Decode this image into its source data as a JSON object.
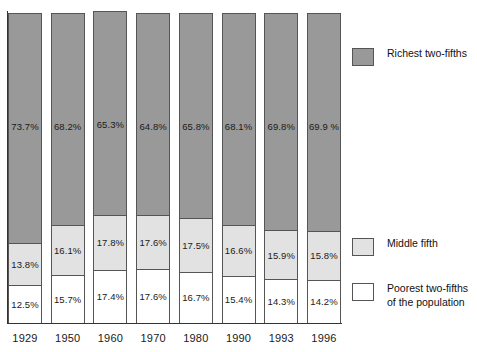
{
  "chart_data": {
    "type": "bar",
    "subtype": "stacked-bar-100-percent",
    "title": "",
    "subtitle": "",
    "xlabel": "",
    "ylabel": "",
    "ylim": [
      0,
      100
    ],
    "grid": false,
    "legend_position": "right",
    "categories": [
      "1929",
      "1950",
      "1960",
      "1970",
      "1980",
      "1990",
      "1993",
      "1996"
    ],
    "series": [
      {
        "name": "Poorest two-fifths of the population",
        "color": "#ffffff",
        "values": [
          12.5,
          15.7,
          17.4,
          17.6,
          16.7,
          15.4,
          14.3,
          14.2
        ],
        "labels": [
          "12.5%",
          "15.7%",
          "17.4%",
          "17.6%",
          "16.7%",
          "15.4%",
          "14.3%",
          "14.2%"
        ]
      },
      {
        "name": "Middle fifth",
        "color": "#e2e2e2",
        "values": [
          13.8,
          16.1,
          17.8,
          17.6,
          17.5,
          16.6,
          15.9,
          15.8
        ],
        "labels": [
          "13.8%",
          "16.1%",
          "17.8%",
          "17.6%",
          "17.5%",
          "16.6%",
          "15.9%",
          "15.8%"
        ]
      },
      {
        "name": "Richest two-fifths",
        "color": "#999999",
        "values": [
          73.7,
          68.2,
          65.3,
          64.8,
          65.8,
          68.1,
          69.8,
          69.9
        ],
        "labels": [
          "73.7%",
          "68.2%",
          "65.3%",
          "64.8%",
          "65.8%",
          "68.1%",
          "69.8%",
          "69.9 %"
        ]
      }
    ]
  },
  "legend": {
    "items": [
      {
        "label": "Richest two-fifths",
        "label_line2": "",
        "swatch": "rich"
      },
      {
        "label": "Middle fifth",
        "label_line2": "",
        "swatch": "middle"
      },
      {
        "label": "Poorest two-fifths",
        "label_line2": "of the population",
        "swatch": "poor"
      }
    ]
  },
  "colors": {
    "richest": "#999999",
    "middle": "#e2e2e2",
    "poorest": "#ffffff",
    "outline": "#555555",
    "axis": "#333333",
    "text": "#1a1a1a"
  }
}
